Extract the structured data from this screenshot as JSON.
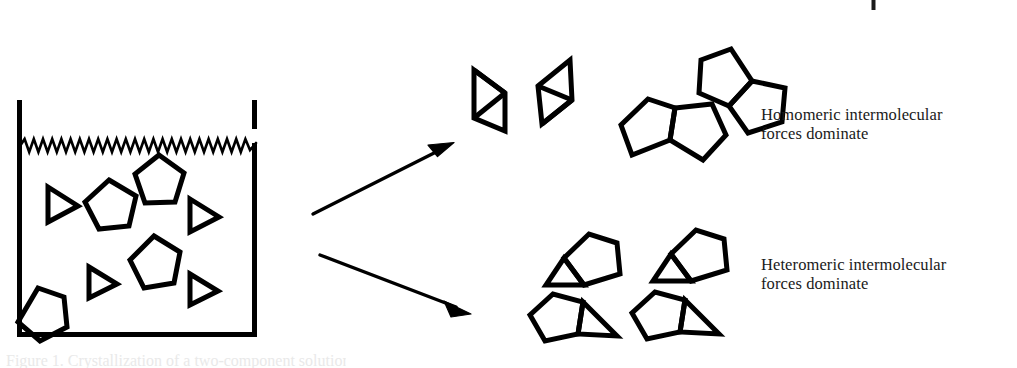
{
  "figure": {
    "type": "scientific-schematic-diagram",
    "background_color": "#ffffff",
    "ink_color": "#000000",
    "width": 1017,
    "height": 368
  },
  "beaker": {
    "name": "beaker-container",
    "description": "Open-topped rectangular vessel containing a mixture of pentagon and triangle molecules",
    "left_wall_x": 17,
    "right_wall_x": 257,
    "top_y": 100,
    "bottom_y": 337,
    "stroke_width": 5,
    "waterline": {
      "name": "zigzag-waterline",
      "style": "sawtooth zigzag",
      "y": 145,
      "amplitude": 6,
      "teeth": 26,
      "stroke_width": 2.4
    },
    "wall_gap": {
      "description": "break in right wall at the meniscus",
      "from_y": 129,
      "to_y": 143
    },
    "contents": {
      "pentagons": [
        {
          "cx": 158,
          "cy": 181,
          "r": 26,
          "rotation": -14
        },
        {
          "cx": 103,
          "cy": 208,
          "r": 27,
          "rotation": 18
        },
        {
          "cx": 153,
          "cy": 263,
          "r": 26,
          "rotation": 8
        },
        {
          "cx": 37,
          "cy": 315,
          "r": 26,
          "rotation": -22
        },
        {
          "cx": 107,
          "cy": 286,
          "r": 0,
          "rotation": 0,
          "note": "triangle slot placeholder"
        }
      ],
      "triangles": [
        {
          "cx": 64,
          "cy": 204,
          "r": 18,
          "rotation": 0
        },
        {
          "cx": 205,
          "cy": 215,
          "r": 18,
          "rotation": 0
        },
        {
          "cx": 103,
          "cy": 281,
          "r": 16,
          "rotation": 0
        },
        {
          "cx": 205,
          "cy": 288,
          "r": 16,
          "rotation": 0
        }
      ],
      "pentagon_count": 5,
      "triangle_count": 5
    }
  },
  "arrows": [
    {
      "name": "arrow-to-homomeric",
      "from_x": 313,
      "from_y": 214,
      "to_x": 453,
      "to_y": 143,
      "stroke_width": 3.2,
      "head": "solid-filled-barbed"
    },
    {
      "name": "arrow-to-heteromeric",
      "from_x": 320,
      "from_y": 255,
      "to_x": 470,
      "to_y": 314,
      "stroke_width": 3.2,
      "head": "solid-filled-barbed"
    }
  ],
  "homomeric_products": {
    "label_line1": "Homomeric intermolecular",
    "label_line2": "forces dominate",
    "triangle_dimers": [
      {
        "name": "triangle-dimer-1",
        "cx": 489,
        "cy": 94,
        "scale": 1.0,
        "rotation": 0
      },
      {
        "name": "triangle-dimer-2",
        "cx": 557,
        "cy": 88,
        "scale": 1.0,
        "rotation": -8
      }
    ],
    "pentagon_dimers": [
      {
        "name": "pentagon-dimer-1",
        "cx": 663,
        "cy": 122,
        "scale": 1.0,
        "rotation": 22
      },
      {
        "name": "pentagon-dimer-2",
        "cx": 743,
        "cy": 66,
        "scale": 1.0,
        "rotation": -42
      }
    ]
  },
  "heteromeric_products": {
    "label_line1": "Heteromeric intermolecular",
    "label_line2": "forces dominate",
    "complexes": [
      {
        "name": "heterodimer-1",
        "cx": 580,
        "cy": 257,
        "triangle_side": "lower-left",
        "rotation": -8
      },
      {
        "name": "heterodimer-2",
        "cx": 687,
        "cy": 253,
        "triangle_side": "lower-left",
        "rotation": -8
      },
      {
        "name": "heterodimer-3",
        "cx": 570,
        "cy": 320,
        "triangle_side": "lower-right",
        "rotation": 4
      },
      {
        "name": "heterodimer-4",
        "cx": 672,
        "cy": 318,
        "triangle_side": "lower-right",
        "rotation": 4
      }
    ]
  },
  "artifacts": {
    "crop_tick": {
      "name": "page-crop-tick-mark",
      "x": 873,
      "y_top": 0,
      "y_bottom": 10,
      "stroke_width": 4
    },
    "bottom_caption_sliver": {
      "name": "clipped-caption-text",
      "text": "Figure 1.  Crystallization of a two-component solution",
      "note": "only the faintest top sliver of the caption line is inside the crop"
    }
  }
}
